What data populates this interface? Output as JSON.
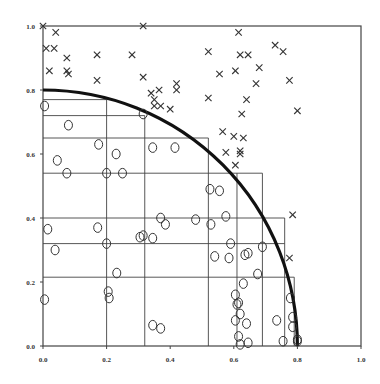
{
  "chart_data": {
    "type": "scatter",
    "title": "",
    "xlabel": "",
    "ylabel": "",
    "xlim": [
      0,
      1
    ],
    "ylim": [
      0,
      1
    ],
    "grid": false,
    "x_ticks": [
      "0.0",
      "0.2",
      "0.4",
      "0.6",
      "0.8",
      "1.0"
    ],
    "y_ticks": [
      "0.0",
      "0.2",
      "0.4",
      "0.6",
      "0.8",
      "1.0"
    ],
    "curve": {
      "name": "quarter circle",
      "radius": 0.8,
      "style": "thick black line"
    },
    "rectangles": [
      {
        "x_end": 0.2,
        "y_top": 0.77
      },
      {
        "x_end": 0.32,
        "y_top": 0.72
      },
      {
        "x_end": 0.52,
        "y_top": 0.65
      },
      {
        "x_end": 0.69,
        "y_top": 0.54
      },
      {
        "x_end": 0.76,
        "y_top": 0.4
      },
      {
        "x_end": 0.76,
        "y_top": 0.32
      },
      {
        "x_end": 0.79,
        "y_top": 0.215
      }
    ],
    "vertical_dividers": [
      {
        "x": 0.2,
        "y_top": 0.77
      },
      {
        "x": 0.32,
        "y_top": 0.72
      },
      {
        "x": 0.52,
        "y_top": 0.65
      },
      {
        "x": 0.61,
        "y_top": 0.54
      },
      {
        "x": 0.69,
        "y_top": 0.54
      },
      {
        "x": 0.76,
        "y_top": 0.4
      },
      {
        "x": 0.79,
        "y_top": 0.215
      }
    ],
    "series": [
      {
        "name": "outside (x)",
        "marker": "x",
        "points": [
          [
            0.0,
            1.0
          ],
          [
            0.04,
            0.98
          ],
          [
            0.01,
            0.93
          ],
          [
            0.035,
            0.93
          ],
          [
            0.075,
            0.9
          ],
          [
            0.02,
            0.86
          ],
          [
            0.075,
            0.86
          ],
          [
            0.08,
            0.85
          ],
          [
            0.17,
            0.91
          ],
          [
            0.17,
            0.83
          ],
          [
            0.28,
            0.91
          ],
          [
            0.315,
            1.0
          ],
          [
            0.315,
            0.84
          ],
          [
            0.42,
            0.82
          ],
          [
            0.42,
            0.8
          ],
          [
            0.34,
            0.79
          ],
          [
            0.365,
            0.8
          ],
          [
            0.35,
            0.77
          ],
          [
            0.37,
            0.75
          ],
          [
            0.4,
            0.74
          ],
          [
            0.35,
            0.75
          ],
          [
            0.52,
            0.92
          ],
          [
            0.615,
            0.98
          ],
          [
            0.62,
            0.91
          ],
          [
            0.645,
            0.91
          ],
          [
            0.73,
            0.94
          ],
          [
            0.755,
            0.92
          ],
          [
            0.555,
            0.85
          ],
          [
            0.605,
            0.86
          ],
          [
            0.68,
            0.87
          ],
          [
            0.67,
            0.82
          ],
          [
            0.775,
            0.83
          ],
          [
            0.52,
            0.775
          ],
          [
            0.64,
            0.77
          ],
          [
            0.625,
            0.725
          ],
          [
            0.8,
            0.735
          ],
          [
            0.565,
            0.67
          ],
          [
            0.6,
            0.655
          ],
          [
            0.63,
            0.65
          ],
          [
            0.575,
            0.605
          ],
          [
            0.62,
            0.61
          ],
          [
            0.62,
            0.6
          ],
          [
            0.605,
            0.565
          ],
          [
            0.785,
            0.41
          ],
          [
            0.775,
            0.275
          ]
        ]
      },
      {
        "name": "inside (o)",
        "marker": "o",
        "points": [
          [
            0.005,
            0.75
          ],
          [
            0.08,
            0.69
          ],
          [
            0.045,
            0.58
          ],
          [
            0.075,
            0.54
          ],
          [
            0.175,
            0.63
          ],
          [
            0.23,
            0.6
          ],
          [
            0.2,
            0.54
          ],
          [
            0.25,
            0.54
          ],
          [
            0.315,
            0.725
          ],
          [
            0.345,
            0.62
          ],
          [
            0.415,
            0.62
          ],
          [
            0.37,
            0.4
          ],
          [
            0.345,
            0.337
          ],
          [
            0.385,
            0.38
          ],
          [
            0.305,
            0.34
          ],
          [
            0.525,
            0.49
          ],
          [
            0.555,
            0.485
          ],
          [
            0.59,
            0.32
          ],
          [
            0.635,
            0.285
          ],
          [
            0.645,
            0.29
          ],
          [
            0.615,
            0.135
          ],
          [
            0.575,
            0.405
          ],
          [
            0.585,
            0.275
          ],
          [
            0.69,
            0.31
          ],
          [
            0.675,
            0.225
          ],
          [
            0.605,
            0.16
          ],
          [
            0.62,
            0.1
          ],
          [
            0.61,
            0.13
          ],
          [
            0.64,
            0.07
          ],
          [
            0.005,
            0.145
          ],
          [
            0.015,
            0.365
          ],
          [
            0.172,
            0.37
          ],
          [
            0.038,
            0.3
          ],
          [
            0.2,
            0.32
          ],
          [
            0.232,
            0.228
          ],
          [
            0.208,
            0.15
          ],
          [
            0.205,
            0.17
          ],
          [
            0.48,
            0.395
          ],
          [
            0.528,
            0.38
          ],
          [
            0.54,
            0.28
          ],
          [
            0.63,
            0.195
          ],
          [
            0.615,
            0.03
          ],
          [
            0.62,
            0.005
          ],
          [
            0.645,
            0.01
          ],
          [
            0.735,
            0.08
          ],
          [
            0.755,
            0.015
          ],
          [
            0.778,
            0.15
          ],
          [
            0.785,
            0.09
          ],
          [
            0.8,
            0.02
          ],
          [
            0.785,
            0.06
          ],
          [
            0.8,
            0.015
          ],
          [
            0.315,
            0.345
          ],
          [
            0.37,
            0.055
          ],
          [
            0.345,
            0.065
          ],
          [
            0.605,
            0.08
          ]
        ]
      }
    ]
  }
}
